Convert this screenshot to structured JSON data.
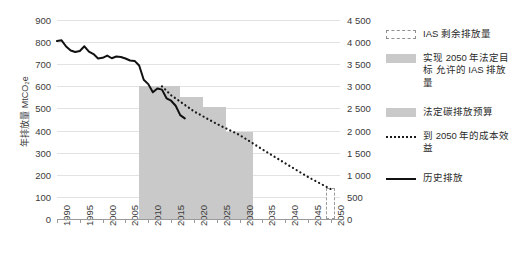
{
  "chart_data": {
    "type": "line",
    "title": "",
    "xlabel": "",
    "ylabel": "年排放量 MtCO₂e",
    "ylabel_right": "",
    "xlim": [
      1990,
      2052
    ],
    "ylim": [
      0,
      900
    ],
    "ylim_right": [
      0,
      4500
    ],
    "grid": true,
    "legend_position": "right",
    "x_ticks": [
      "1990",
      "1995",
      "2000",
      "2005",
      "2010",
      "2015",
      "2020",
      "2025",
      "2030",
      "2035",
      "2040",
      "2045",
      "2050"
    ],
    "y_ticks_left": [
      "0",
      "100",
      "200",
      "300",
      "400",
      "500",
      "600",
      "700",
      "800",
      "900"
    ],
    "y_ticks_right": [
      "0",
      "500",
      "1 000",
      "1 500",
      "2 000",
      "2 500",
      "3 000",
      "3 500",
      "4 000",
      "4 500"
    ],
    "series": [
      {
        "name": "历史排放",
        "style": "solid-line",
        "color": "#111111",
        "x": [
          1990,
          1991,
          1992,
          1993,
          1994,
          1995,
          1996,
          1997,
          1998,
          1999,
          2000,
          2001,
          2002,
          2003,
          2004,
          2005,
          2006,
          2007,
          2008,
          2009,
          2010,
          2011,
          2012,
          2013,
          2014,
          2015,
          2016,
          2017,
          2018
        ],
        "values": [
          805,
          808,
          780,
          762,
          755,
          760,
          781,
          757,
          746,
          726,
          729,
          739,
          727,
          735,
          733,
          726,
          717,
          715,
          694,
          630,
          610,
          573,
          590,
          585,
          546,
          535,
          512,
          470,
          455
        ]
      },
      {
        "name": "到 2050 年的成本效益",
        "style": "dotted-line",
        "color": "#1a1a1a",
        "x": [
          2013,
          2015,
          2020,
          2025,
          2030,
          2035,
          2040,
          2045,
          2050
        ],
        "values": [
          600,
          560,
          487,
          430,
          380,
          315,
          252,
          190,
          135
        ]
      }
    ],
    "bars": [
      {
        "name": "法定碳排放预算",
        "start": 2008,
        "end": 2017,
        "value": 600,
        "fill": "#c9c9c9"
      },
      {
        "name": "法定碳排放预算",
        "start": 2017,
        "end": 2022,
        "value": 552,
        "fill": "#c9c9c9"
      },
      {
        "name": "法定碳排放预算",
        "start": 2022,
        "end": 2027,
        "value": 507,
        "fill": "#c9c9c9"
      },
      {
        "name": "法定碳排放预算",
        "start": 2027,
        "end": 2033,
        "value": 394,
        "fill": "#c9c9c9"
      },
      {
        "name": "IAS 剩余排放量",
        "start": 2049,
        "end": 2051,
        "value": 140,
        "fill": "#c9c9c9",
        "outline": "dashed"
      }
    ],
    "legend": [
      {
        "label": "IAS 剩余排放量",
        "swatch": "dashed-box"
      },
      {
        "label": "实现 2050 年法定目标 允许的 IAS 排放量",
        "swatch": "filled-box"
      },
      {
        "label": "法定碳排放预算",
        "swatch": "filled-box"
      },
      {
        "label": "到 2050 年的成本效益",
        "swatch": "dotted-line"
      },
      {
        "label": "历史排放",
        "swatch": "solid-line"
      }
    ],
    "colors": {
      "bar_fill": "#c9c9c9",
      "grid": "#e2e2e2",
      "axis": "#9a9a9a",
      "line": "#111111",
      "text": "#3b3b3b",
      "background": "#ffffff"
    }
  }
}
